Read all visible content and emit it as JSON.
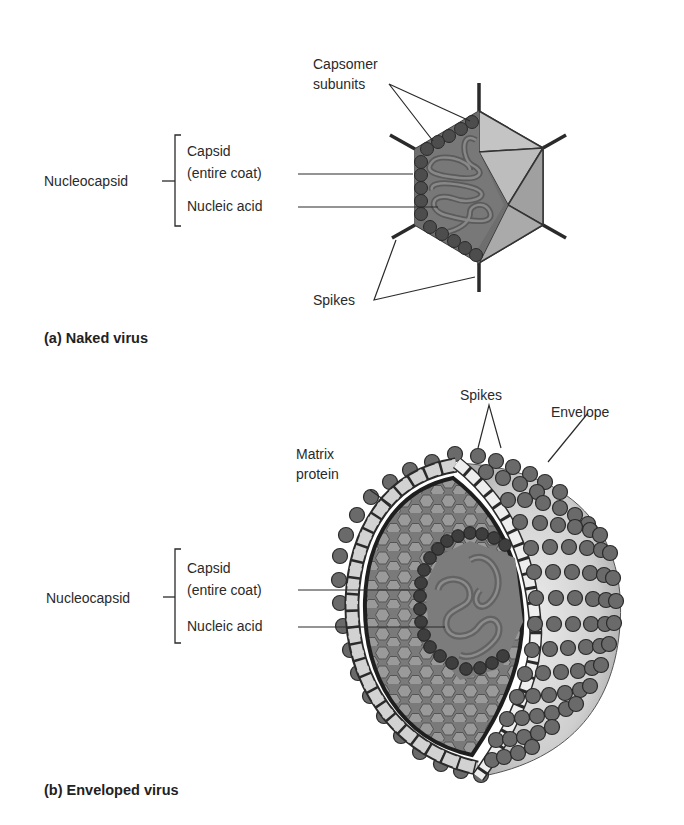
{
  "panel_a": {
    "caption": "(a) Naked virus",
    "labels": {
      "capsomer_line1": "Capsomer",
      "capsomer_line2": "subunits",
      "nucleocapsid": "Nucleocapsid",
      "capsid_line1": "Capsid",
      "capsid_line2": "(entire coat)",
      "nucleic_acid": "Nucleic acid",
      "spikes": "Spikes"
    }
  },
  "panel_b": {
    "caption": "(b) Enveloped virus",
    "labels": {
      "spikes": "Spikes",
      "envelope": "Envelope",
      "matrix_line1": "Matrix",
      "matrix_line2": "protein",
      "nucleocapsid": "Nucleocapsid",
      "capsid_line1": "Capsid",
      "capsid_line2": "(entire coat)",
      "nucleic_acid": "Nucleic acid"
    }
  },
  "colors": {
    "text": "#2a2a2a",
    "dark_gray": "#555555",
    "mid_gray": "#8a8a8a",
    "light_gray": "#b5b5b5",
    "capsomer": "#505050"
  }
}
